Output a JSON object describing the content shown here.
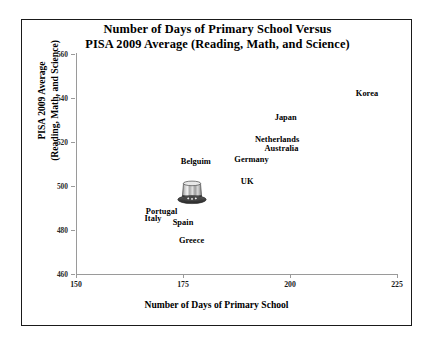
{
  "chart_data": {
    "type": "scatter",
    "title": "Number of Days of Primary School Versus PISA 2009 Average (Reading, Math, and Science)",
    "title_lines": [
      "Number of Days of Primary School Versus",
      "PISA 2009 Average (Reading, Math, and Science)"
    ],
    "xlabel": "Number of Days of Primary School",
    "ylabel": "PISA 2009 Average (Reading, Math, and Science)",
    "ylabel_lines": [
      "PISA 2009 Average",
      "(Reading, Math, and Science)"
    ],
    "xlim": [
      150,
      225
    ],
    "ylim": [
      460,
      560
    ],
    "xticks": [
      150,
      175,
      200,
      225
    ],
    "yticks": [
      460,
      480,
      500,
      520,
      540,
      560
    ],
    "grid": false,
    "legend": "none",
    "marker": "top-hat-image",
    "points": [
      {
        "label": "Korea",
        "x": 218,
        "y": 542
      },
      {
        "label": "Japan",
        "x": 199,
        "y": 531
      },
      {
        "label": "Netherlands",
        "x": 197,
        "y": 521
      },
      {
        "label": "Australia",
        "x": 198,
        "y": 517
      },
      {
        "label": "Germany",
        "x": 191,
        "y": 512
      },
      {
        "label": "Belguim",
        "x": 178,
        "y": 511
      },
      {
        "label": "UK",
        "x": 190,
        "y": 502
      },
      {
        "label": "Portugal",
        "x": 170,
        "y": 488
      },
      {
        "label": "Italy",
        "x": 168,
        "y": 485
      },
      {
        "label": "Spain",
        "x": 175,
        "y": 483
      },
      {
        "label": "Greece",
        "x": 177,
        "y": 475
      }
    ],
    "marker_point": {
      "x": 177,
      "y": 498
    }
  },
  "colors": {
    "frame": "#1a1a1a",
    "axis": "#9a9a9a",
    "text": "#000000",
    "background": "#ffffff",
    "hat_body": "#b4b4b4",
    "hat_band": "#3a3a3a"
  }
}
